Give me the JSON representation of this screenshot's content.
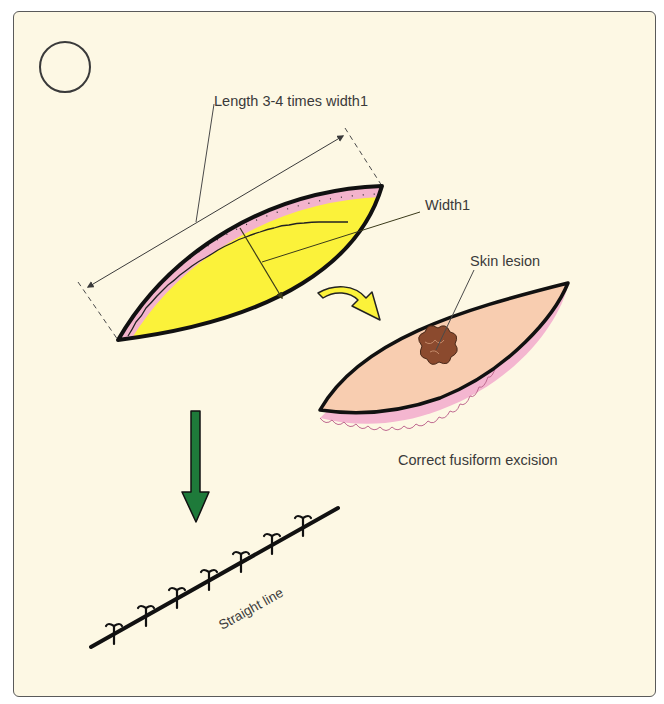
{
  "figure": {
    "panel_marker": "",
    "labels": {
      "length": "Length 3-4 times width1",
      "width": "Width1",
      "lesion": "Skin lesion",
      "excision": "Correct fusiform excision",
      "line": "Straight line"
    },
    "colors": {
      "background": "#fdf8e4",
      "frame": "#5a5a5a",
      "wound_fill": "#fbf23a",
      "wound_edge_teeth": "#f3b3cc",
      "specimen_skin": "#f8cdb0",
      "specimen_underside": "#f4b6d0",
      "lesion": "#8b4a2e",
      "yellow_arrow": "#fbf23a",
      "green_arrow": "#1e7a3a",
      "outline": "#111111",
      "leader_line": "#4a4a4a"
    },
    "sutures": {
      "count": 7
    }
  }
}
